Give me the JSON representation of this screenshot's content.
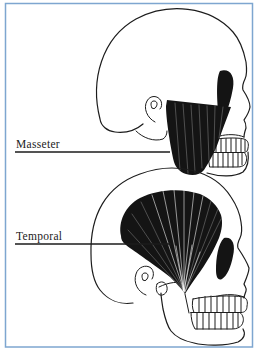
{
  "diagram": {
    "type": "anatomical-illustration",
    "frame_color": "#7ea6d0",
    "ink_color": "#1c1c1c",
    "background": "#ffffff",
    "panels": [
      {
        "muscle": "masseter",
        "label": "Masseter"
      },
      {
        "muscle": "temporal",
        "label": "Temporal"
      }
    ]
  }
}
